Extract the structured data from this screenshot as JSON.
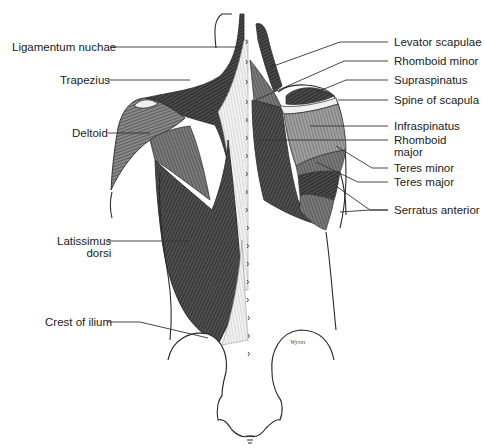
{
  "figure": {
    "signature": "Wynn",
    "colors": {
      "background": "#ffffff",
      "muscle_dark": "#3c3c3c",
      "muscle_mid": "#5e5e5e",
      "muscle_light": "#8a8a8a",
      "tendon": "#e8e8e8",
      "line": "#2a2a2a",
      "label_text": "#222222"
    }
  },
  "labels": {
    "left": [
      {
        "id": "ligamentum-nuchae",
        "text": "Ligamentum nuchae"
      },
      {
        "id": "trapezius",
        "text": "Trapezius"
      },
      {
        "id": "deltoid",
        "text": "Deltoid"
      },
      {
        "id": "latissimus-dorsi-1",
        "text": "Latissimus"
      },
      {
        "id": "latissimus-dorsi-2",
        "text": "dorsi"
      },
      {
        "id": "crest-of-ilium",
        "text": "Crest of ilium"
      }
    ],
    "right": [
      {
        "id": "levator-scapulae",
        "text": "Levator scapulae"
      },
      {
        "id": "rhomboid-minor",
        "text": "Rhomboid minor"
      },
      {
        "id": "supraspinatus",
        "text": "Supraspinatus"
      },
      {
        "id": "spine-of-scapula",
        "text": "Spine of scapula"
      },
      {
        "id": "infraspinatus",
        "text": "Infraspinatus"
      },
      {
        "id": "rhomboid-major-1",
        "text": "Rhomboid"
      },
      {
        "id": "rhomboid-major-2",
        "text": "major"
      },
      {
        "id": "teres-minor",
        "text": "Teres minor"
      },
      {
        "id": "teres-major",
        "text": "Teres major"
      },
      {
        "id": "serratus-anterior",
        "text": "Serratus anterior"
      }
    ]
  }
}
